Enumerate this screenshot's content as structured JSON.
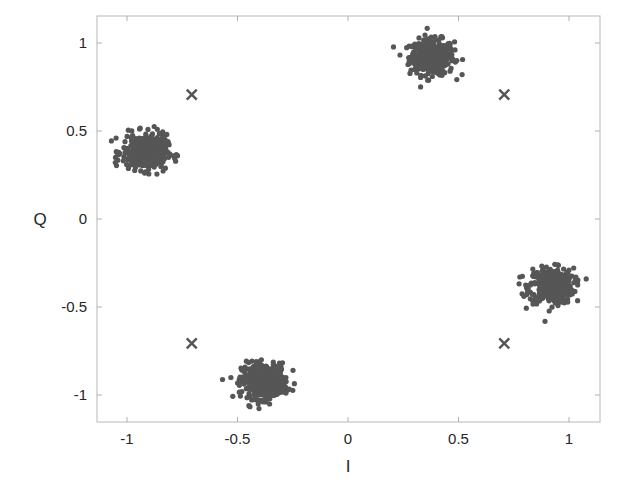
{
  "chart_data": {
    "type": "scatter",
    "title": "",
    "xlabel": "I",
    "ylabel": "Q",
    "xlim": [
      -1.15,
      1.15
    ],
    "ylim": [
      -1.15,
      1.15
    ],
    "xticks": [
      -1,
      -0.5,
      0,
      0.5,
      1
    ],
    "xtick_labels": [
      "-1",
      "-0.5",
      "0",
      "0.5",
      "1"
    ],
    "yticks": [
      1,
      0.5,
      0,
      -0.5,
      -1
    ],
    "ytick_labels": [
      "1",
      "0.5",
      "0",
      "-0.5",
      "-1"
    ],
    "grid": false,
    "series": [
      {
        "name": "received symbols",
        "marker": "dot",
        "color": "#565656",
        "clusters": [
          {
            "center": [
              0.38,
              0.92
            ],
            "spread": 0.05,
            "count": 400
          },
          {
            "center": [
              0.92,
              -0.38
            ],
            "spread": 0.05,
            "count": 400
          },
          {
            "center": [
              -0.38,
              -0.92
            ],
            "spread": 0.05,
            "count": 400
          },
          {
            "center": [
              -0.92,
              0.38
            ],
            "spread": 0.05,
            "count": 400
          }
        ]
      },
      {
        "name": "reference constellation",
        "marker": "x",
        "color": "#565656",
        "points": [
          [
            0.707,
            0.707
          ],
          [
            0.707,
            -0.707
          ],
          [
            -0.707,
            -0.707
          ],
          [
            -0.707,
            0.707
          ]
        ]
      }
    ]
  },
  "colors": {
    "axis": "#b0b0b0",
    "text": "#262626",
    "dots": "#565656"
  }
}
